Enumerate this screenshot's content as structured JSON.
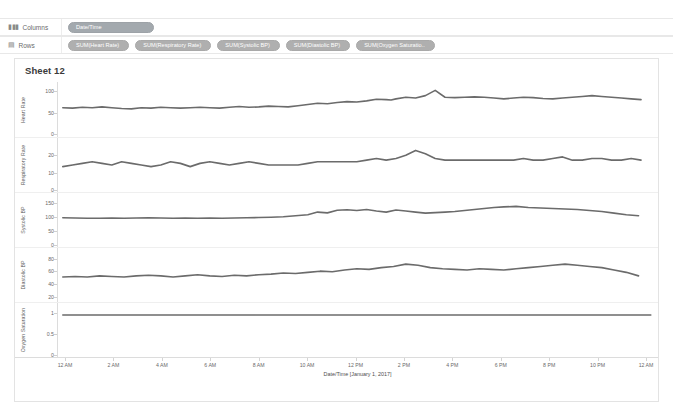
{
  "shelves": {
    "columns": {
      "label": "Columns",
      "icon": "columns-icon",
      "glyph": "▮▮▮",
      "pills": [
        {
          "label": "Date/Time",
          "type": "dimension"
        }
      ]
    },
    "rows": {
      "label": "Rows",
      "icon": "rows-icon",
      "glyph": "▤",
      "pills": [
        {
          "label": "SUM(Heart Rate)",
          "type": "measure"
        },
        {
          "label": "SUM(Respiratory Rate)",
          "type": "measure"
        },
        {
          "label": "SUM(Systolic BP)",
          "type": "measure"
        },
        {
          "label": "SUM(Diastolic BP)",
          "type": "measure"
        },
        {
          "label": "SUM(Oxygen Saturatio..",
          "type": "measure"
        }
      ]
    }
  },
  "worksheet": {
    "title": "Sheet 12"
  },
  "chart_data": {
    "type": "line",
    "title": "Sheet 12",
    "xlabel": "Date/Time [January 1, 2017]",
    "grid": false,
    "legend": false,
    "line_color": "#6b6b6b",
    "x_ticks": [
      "12 AM",
      "2 AM",
      "4 AM",
      "6 AM",
      "8 AM",
      "10 AM",
      "12 PM",
      "2 PM",
      "4 PM",
      "6 PM",
      "8 PM",
      "10 PM",
      "12 AM"
    ],
    "x_tick_hours": [
      0,
      2,
      4,
      6,
      8,
      10,
      12,
      14,
      16,
      18,
      20,
      22,
      24
    ],
    "xlim": [
      0,
      24
    ],
    "panels": [
      {
        "ylabel": "Heart Rate",
        "y_ticks": [
          0,
          50,
          100
        ],
        "ylim": [
          0,
          115
        ],
        "x": [
          0,
          0.4,
          0.8,
          1.2,
          1.6,
          2,
          2.4,
          2.8,
          3.2,
          3.6,
          4,
          4.4,
          4.8,
          5.2,
          5.6,
          6,
          6.4,
          6.8,
          7.2,
          7.6,
          8,
          8.4,
          8.8,
          9.2,
          9.6,
          10,
          10.4,
          10.8,
          11.2,
          11.6,
          12,
          12.4,
          12.8,
          13.2,
          13.4,
          13.6,
          14,
          14.4,
          14.8,
          15.2,
          15.6,
          16,
          16.4,
          16.8,
          17.2,
          17.6,
          18,
          18.4,
          18.8,
          19.2,
          19.6,
          20,
          20.4,
          20.8,
          21.2,
          21.6,
          22,
          22.4,
          22.8,
          23.2,
          23.6
        ],
        "values": [
          62,
          61,
          63,
          62,
          64,
          62,
          60,
          59,
          62,
          61,
          63,
          62,
          61,
          62,
          63,
          62,
          61,
          63,
          65,
          63,
          64,
          66,
          65,
          64,
          67,
          70,
          73,
          72,
          75,
          77,
          76,
          79,
          83,
          82,
          81,
          84,
          88,
          86,
          92,
          105,
          88,
          87,
          88,
          89,
          88,
          86,
          84,
          86,
          88,
          87,
          85,
          84,
          86,
          88,
          90,
          92,
          90,
          88,
          86,
          84,
          82
        ]
      },
      {
        "ylabel": "Respiratory Rate",
        "y_ticks": [
          0,
          10,
          20
        ],
        "ylim": [
          0,
          28
        ],
        "x": [
          0,
          0.4,
          0.8,
          1.2,
          1.6,
          2,
          2.4,
          2.8,
          3.2,
          3.6,
          4,
          4.4,
          4.8,
          5.2,
          5.6,
          6,
          6.4,
          6.8,
          7.2,
          7.6,
          8,
          8.4,
          8.8,
          9.2,
          9.6,
          10,
          10.4,
          10.8,
          11.2,
          11.6,
          12,
          12.4,
          12.8,
          13.2,
          13.6,
          14,
          14.4,
          14.8,
          15.2,
          15.6,
          16,
          16.4,
          16.8,
          17.2,
          17.6,
          18,
          18.4,
          18.8,
          19.2,
          19.6,
          20,
          20.4,
          20.8,
          21.2,
          21.6,
          22,
          22.4,
          22.8,
          23.2,
          23.6
        ],
        "values": [
          13,
          14,
          15,
          16,
          15,
          14,
          16,
          15,
          14,
          13,
          14,
          16,
          15,
          13,
          15,
          16,
          15,
          14,
          15,
          16,
          15,
          14,
          14,
          14,
          14,
          15,
          16,
          16,
          16,
          16,
          16,
          17,
          18,
          17,
          18,
          20,
          23,
          21,
          18,
          17,
          17,
          17,
          17,
          17,
          17,
          17,
          17,
          18,
          17,
          17,
          18,
          19,
          17,
          17,
          18,
          18,
          17,
          17,
          18,
          17
        ]
      },
      {
        "ylabel": "Systolic BP",
        "y_ticks": [
          0,
          50,
          100,
          150
        ],
        "ylim": [
          0,
          175
        ],
        "x": [
          0,
          0.5,
          1,
          1.5,
          2,
          2.5,
          3,
          3.5,
          4,
          4.5,
          5,
          5.5,
          6,
          6.5,
          7,
          7.5,
          8,
          8.5,
          9,
          9.5,
          10,
          10.4,
          10.8,
          11.2,
          11.6,
          12,
          12.4,
          12.8,
          13.2,
          13.6,
          14,
          14.4,
          14.8,
          15.2,
          15.6,
          16,
          16.4,
          16.8,
          17.2,
          17.6,
          18,
          18.5,
          19,
          19.5,
          20,
          20.5,
          21,
          21.5,
          22,
          22.5,
          23,
          23.5
        ],
        "values": [
          96,
          95,
          94,
          94,
          95,
          94,
          95,
          96,
          95,
          94,
          95,
          94,
          95,
          94,
          95,
          96,
          97,
          98,
          100,
          104,
          108,
          118,
          115,
          125,
          127,
          124,
          128,
          122,
          118,
          126,
          122,
          118,
          114,
          116,
          118,
          120,
          124,
          128,
          132,
          136,
          138,
          140,
          136,
          134,
          132,
          130,
          128,
          124,
          120,
          114,
          108,
          104
        ]
      },
      {
        "ylabel": "Diastolic BP",
        "y_ticks": [
          20,
          40,
          60,
          80
        ],
        "ylim": [
          15,
          92
        ],
        "x": [
          0,
          0.5,
          1,
          1.5,
          2,
          2.5,
          3,
          3.5,
          4,
          4.5,
          5,
          5.5,
          6,
          6.5,
          7,
          7.5,
          8,
          8.5,
          9,
          9.5,
          10,
          10.5,
          11,
          11.5,
          12,
          12.5,
          13,
          13.5,
          14,
          14.5,
          15,
          15.5,
          16,
          16.5,
          17,
          17.5,
          18,
          18.5,
          19,
          19.5,
          20,
          20.5,
          21,
          21.5,
          22,
          22.5,
          23,
          23.5
        ],
        "values": [
          50,
          51,
          50,
          52,
          51,
          50,
          52,
          53,
          52,
          50,
          52,
          54,
          52,
          51,
          53,
          52,
          54,
          55,
          57,
          56,
          58,
          60,
          59,
          62,
          64,
          63,
          66,
          68,
          72,
          70,
          66,
          64,
          63,
          62,
          64,
          63,
          62,
          64,
          66,
          68,
          70,
          72,
          70,
          68,
          66,
          62,
          58,
          52
        ]
      },
      {
        "ylabel": "Oxygen Saturation",
        "y_ticks": [
          0,
          0.5,
          1.0
        ],
        "ylim": [
          0,
          1.18
        ],
        "x": [
          0,
          2,
          4,
          6,
          8,
          10,
          12,
          14,
          16,
          18,
          20,
          22,
          24
        ],
        "values": [
          0.98,
          0.98,
          0.98,
          0.98,
          0.98,
          0.98,
          0.98,
          0.98,
          0.98,
          0.98,
          0.98,
          0.98,
          0.98
        ]
      }
    ]
  }
}
